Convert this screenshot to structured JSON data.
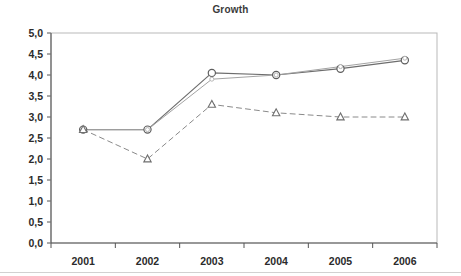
{
  "chart_data": {
    "type": "line",
    "title": "Growth",
    "xlabel": "",
    "ylabel": "",
    "categories": [
      "2001",
      "2002",
      "2003",
      "2004",
      "2005",
      "2006"
    ],
    "ylim": [
      0.0,
      5.0
    ],
    "ytick_step": 0.5,
    "ytick_labels": [
      "0,0",
      "0,5",
      "1,0",
      "1,5",
      "2,0",
      "2,5",
      "3,0",
      "3,5",
      "4,0",
      "4,5",
      "5,0"
    ],
    "ytick_values": [
      0.0,
      0.5,
      1.0,
      1.5,
      2.0,
      2.5,
      3.0,
      3.5,
      4.0,
      4.5,
      5.0
    ],
    "decimal_separator": ",",
    "grid": false,
    "legend": "none",
    "series": [
      {
        "name": "series-1",
        "style": "solid",
        "marker": "circle",
        "color": "#6d6d6d",
        "values": [
          2.7,
          2.7,
          4.05,
          4.0,
          4.15,
          4.35
        ]
      },
      {
        "name": "series-2",
        "style": "solid",
        "marker": "none",
        "color": "#a3a3a3",
        "values": [
          2.7,
          2.7,
          3.9,
          4.0,
          4.2,
          4.4
        ]
      },
      {
        "name": "series-3",
        "style": "dashed",
        "marker": "triangle",
        "color": "#8a8a8a",
        "values": [
          2.7,
          2.0,
          3.3,
          3.1,
          3.0,
          3.0
        ]
      }
    ]
  },
  "axis": {
    "y_min_label": "0,0",
    "y_max_label": "5,0"
  }
}
